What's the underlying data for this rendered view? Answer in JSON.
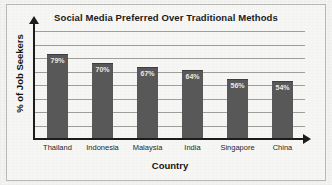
{
  "chart_data": {
    "type": "bar",
    "title": "Social Media Preferred Over Traditional Methods",
    "xlabel": "Country",
    "ylabel": "% of Job Seekers",
    "categories": [
      "Thailand",
      "Indonesia",
      "Malaysia",
      "India",
      "Singapore",
      "China"
    ],
    "values": [
      79,
      70,
      67,
      64,
      56,
      54
    ],
    "value_labels": [
      "79%",
      "70%",
      "67%",
      "64%",
      "56%",
      "54%"
    ],
    "ylim": [
      0,
      100
    ],
    "grid": true,
    "gridline_count": 8,
    "legend": null,
    "legend_position": "none",
    "tick_labels_y": [],
    "colors": {
      "bar": "#585858",
      "bar_value_text": "#e9e9e9",
      "axis": "#1c1c1c",
      "gridline": "#9d9d9a",
      "background": "#f3f3f1",
      "frame_border": "#b9b9b6",
      "title_text": "#1b1b1b"
    }
  }
}
